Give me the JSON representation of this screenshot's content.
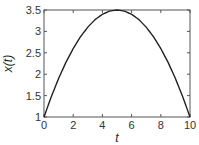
{
  "chart_data": {
    "type": "line",
    "title": "",
    "xlabel": "t",
    "ylabel": "x(t)",
    "xlim": [
      0,
      10
    ],
    "ylim": [
      1,
      3.5
    ],
    "xticks": [
      0,
      2,
      4,
      6,
      8,
      10
    ],
    "xtick_labels": [
      "0",
      "2",
      "4",
      "6",
      "8",
      "10"
    ],
    "yticks": [
      1,
      1.5,
      2,
      2.5,
      3,
      3.5
    ],
    "ytick_labels": [
      "1",
      "1.5",
      "2",
      "2.5",
      "3",
      "3.5"
    ],
    "grid": false,
    "box": true,
    "legend": null,
    "series": [
      {
        "name": "x(t)",
        "color": "#222222",
        "x": [
          0,
          0.5,
          1,
          1.5,
          2,
          2.5,
          3,
          3.5,
          4,
          4.5,
          5,
          5.5,
          6,
          6.5,
          7,
          7.5,
          8,
          8.5,
          9,
          9.5,
          10
        ],
        "y": [
          1,
          1.475,
          1.9,
          2.275,
          2.6,
          2.875,
          3.1,
          3.275,
          3.4,
          3.475,
          3.5,
          3.475,
          3.4,
          3.275,
          3.1,
          2.875,
          2.6,
          2.275,
          1.9,
          1.475,
          1
        ]
      }
    ]
  },
  "layout": {
    "plot_left": 44,
    "plot_right": 190,
    "plot_top": 10,
    "plot_bottom": 117,
    "axis_color": "#555555",
    "line_color": "#222222"
  }
}
